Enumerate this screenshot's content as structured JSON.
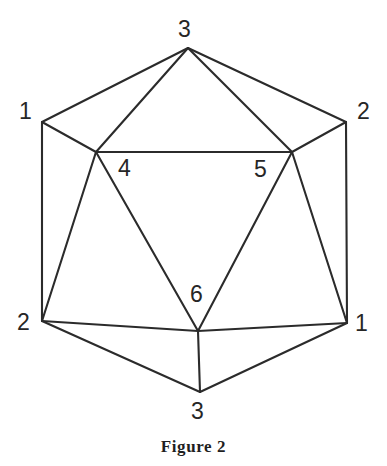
{
  "figure": {
    "caption": "Figure 2",
    "caption_x": 0,
    "caption_y": 437,
    "background_color": "#ffffff",
    "line_color": "#2b2b2b",
    "label_color": "#262626",
    "width": 387,
    "height": 466
  },
  "diagram": {
    "type": "planar-graph",
    "vertices": [
      {
        "id": "top-apex",
        "label": "3",
        "x": 188,
        "y": 48,
        "label_x": 178,
        "label_y": 18
      },
      {
        "id": "upper-left",
        "label": "1",
        "x": 42,
        "y": 122,
        "label_x": 19,
        "label_y": 100
      },
      {
        "id": "upper-right",
        "label": "2",
        "x": 346,
        "y": 122,
        "label_x": 357,
        "label_y": 100
      },
      {
        "id": "inner-left",
        "label": "4",
        "x": 96,
        "y": 152,
        "label_x": 118,
        "label_y": 157
      },
      {
        "id": "inner-right",
        "label": "5",
        "x": 292,
        "y": 152,
        "label_x": 254,
        "label_y": 158
      },
      {
        "id": "lower-left",
        "label": "2",
        "x": 42,
        "y": 321,
        "label_x": 17,
        "label_y": 311
      },
      {
        "id": "lower-right",
        "label": "1",
        "x": 347,
        "y": 323,
        "label_x": 355,
        "label_y": 312
      },
      {
        "id": "inner-bottom",
        "label": "6",
        "x": 198,
        "y": 331,
        "label_x": 190,
        "label_y": 283
      },
      {
        "id": "bottom-apex",
        "label": "3",
        "x": 200,
        "y": 392,
        "label_x": 191,
        "label_y": 400
      }
    ],
    "edges": [
      {
        "from": "top-apex",
        "to": "upper-left",
        "path": "M 188 48 L 42 122"
      },
      {
        "from": "top-apex",
        "to": "upper-right",
        "path": "M 188 48 L 346 122"
      },
      {
        "from": "top-apex",
        "to": "inner-left",
        "path": "M 188 48 L 96 152"
      },
      {
        "from": "top-apex",
        "to": "inner-right",
        "path": "M 188 48 L 292 152"
      },
      {
        "from": "upper-left",
        "to": "inner-left",
        "path": "M 42 122 L 96 152"
      },
      {
        "from": "upper-right",
        "to": "inner-right",
        "path": "M 346 122 L 292 152"
      },
      {
        "from": "upper-left",
        "to": "lower-left",
        "path": "M 42 122 L 42 321"
      },
      {
        "from": "upper-right",
        "to": "lower-right",
        "path": "M 346 122 L 347 323"
      },
      {
        "from": "inner-left",
        "to": "inner-right",
        "path": "M 96 152 L 292 152"
      },
      {
        "from": "inner-left",
        "to": "lower-left",
        "path": "M 96 152 L 42 321"
      },
      {
        "from": "inner-right",
        "to": "lower-right",
        "path": "M 292 152 L 347 323"
      },
      {
        "from": "inner-left",
        "to": "inner-bottom",
        "path": "M 96 152 L 198 331"
      },
      {
        "from": "inner-right",
        "to": "inner-bottom",
        "path": "M 292 152 L 198 331"
      },
      {
        "from": "lower-left",
        "to": "inner-bottom",
        "path": "M 42 321 L 198 331"
      },
      {
        "from": "lower-right",
        "to": "inner-bottom",
        "path": "M 347 323 L 198 331"
      },
      {
        "from": "lower-left",
        "to": "bottom-apex",
        "path": "M 42 321 L 200 392"
      },
      {
        "from": "lower-right",
        "to": "bottom-apex",
        "path": "M 347 323 L 200 392"
      },
      {
        "from": "inner-bottom",
        "to": "bottom-apex",
        "path": "M 198 331 L 200 392"
      }
    ]
  }
}
